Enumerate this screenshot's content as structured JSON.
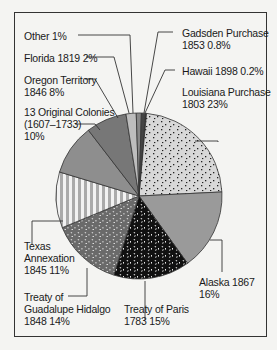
{
  "chart_data": {
    "type": "pie",
    "title": "",
    "slices": [
      {
        "name": "Louisiana Purchase",
        "year": "1803",
        "value": 23,
        "label": "Louisiana Purchase 1803 23%"
      },
      {
        "name": "Alaska",
        "year": "1867",
        "value": 16,
        "label": "Alaska 1867 16%"
      },
      {
        "name": "Treaty of Paris",
        "year": "1783",
        "value": 15,
        "label": "Treaty of Paris 1783 15%"
      },
      {
        "name": "Treaty of Guadalupe Hidalgo",
        "year": "1848",
        "value": 14,
        "label": "Treaty of Guadalupe Hidalgo 1848 14%"
      },
      {
        "name": "Texas Annexation",
        "year": "1845",
        "value": 11,
        "label": "Texas Annexation 1845 11%"
      },
      {
        "name": "13 Original Colonies",
        "year": "(1607–1733)",
        "value": 10,
        "label": "13 Original Colonies (1607–1733) 10%"
      },
      {
        "name": "Oregon Territory",
        "year": "1846",
        "value": 8,
        "label": "Oregon Territory 1846 8%"
      },
      {
        "name": "Florida",
        "year": "1819",
        "value": 2,
        "label": "Florida 1819 2%"
      },
      {
        "name": "Other",
        "year": "",
        "value": 1,
        "label": "Other 1%"
      },
      {
        "name": "Gadsden Purchase",
        "year": "1853",
        "value": 0.8,
        "label": "Gadsden Purchase 1853 0.8%"
      },
      {
        "name": "Hawaii",
        "year": "1898",
        "value": 0.2,
        "label": "Hawaii 1898 0.2%"
      }
    ],
    "unit": "%",
    "legend": "none (direct labels with leader lines)"
  },
  "labels": {
    "other": {
      "line1": "Other  1%"
    },
    "florida": {
      "line1": "Florida 1819  2%"
    },
    "oregon": {
      "line1": "Oregon Territory",
      "line2": "1846  8%"
    },
    "colonies": {
      "line1": "13 Original Colonies",
      "line2": "(1607–1733)",
      "line3": "10%"
    },
    "texas": {
      "line1": "Texas",
      "line2": "Annexation",
      "line3": "1845  11%"
    },
    "guadalupe": {
      "line1": "Treaty of",
      "line2": "Guadalupe Hidalgo",
      "line3": "1848  14%"
    },
    "paris": {
      "line1": "Treaty of Paris",
      "line2": "1783  15%"
    },
    "alaska": {
      "line1": "Alaska 1867",
      "line2": "16%"
    },
    "louisiana": {
      "line1": "Louisiana Purchase",
      "line2": "1803  23%"
    },
    "hawaii": {
      "line1": "Hawaii 1898  0.2%"
    },
    "gadsden": {
      "line1": "Gadsden Purchase",
      "line2": "1853  0.8%"
    }
  }
}
